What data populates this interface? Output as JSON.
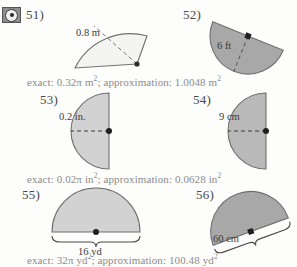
{
  "page": {
    "background_color": "#fdfdfb",
    "text_color": "#3b3b3b",
    "answer_text_color": "#8c8c8c"
  },
  "media_icon": {
    "name": "media-placeholder-icon",
    "label": ""
  },
  "problems": [
    {
      "number": "51)",
      "shape": "sector",
      "fill_color": "#f4f4f2",
      "stroke_color": "#6f6f6f",
      "measure_label": "0.8 m",
      "dimension_type": "radius",
      "dimension_style": "dashed-radius"
    },
    {
      "number": "52)",
      "shape": "semicircle-tilted",
      "fill_color": "#a8a8a8",
      "stroke_color": "#6f6f6f",
      "measure_label": "6 ft",
      "dimension_type": "radius",
      "dimension_style": "dashed-radius"
    },
    {
      "number": "53)",
      "shape": "semicircle-left",
      "fill_color": "#d2d2d2",
      "stroke_color": "#6f6f6f",
      "measure_label": "0.2 in.",
      "dimension_type": "radius",
      "dimension_style": "dashed-radius"
    },
    {
      "number": "54)",
      "shape": "semicircle-left",
      "fill_color": "#b9b9b9",
      "stroke_color": "#6f6f6f",
      "measure_label": "9 cm",
      "dimension_type": "radius",
      "dimension_style": "dashed-radius"
    },
    {
      "number": "55)",
      "shape": "semicircle-up",
      "fill_color": "#d2d2d2",
      "stroke_color": "#6f6f6f",
      "measure_label": "16 yd",
      "dimension_type": "diameter",
      "dimension_style": "brace"
    },
    {
      "number": "56)",
      "shape": "semicircle-tilted",
      "fill_color": "#a8a8a8",
      "stroke_color": "#6f6f6f",
      "measure_label": "60 cm",
      "dimension_type": "diameter",
      "dimension_style": "brace"
    }
  ],
  "answers": [
    {
      "id": "answer-51",
      "prefix": "exact: 0.32",
      "pi": "π",
      "unit": "m",
      "exp1": "2",
      "middle": "; approximation: 1.0048 m",
      "exp2": "2",
      "full_text": "exact: 0.32π m²; approximation: 1.0048 m²"
    },
    {
      "id": "answer-53",
      "prefix": "exact: 0.02",
      "pi": "π",
      "unit": "in",
      "exp1": "2",
      "middle": "; approximation: 0.0628 in",
      "exp2": "2",
      "full_text": "exact: 0.02π in²; approximation: 0.0628 in²"
    },
    {
      "id": "answer-55",
      "prefix": "exact: 32",
      "pi": "π",
      "unit": "yd",
      "exp1": "2",
      "middle": "; approximation: 100.48 yd",
      "exp2": "2",
      "full_text": "exact: 32π yd²; approximation: 100.48 yd²"
    }
  ]
}
